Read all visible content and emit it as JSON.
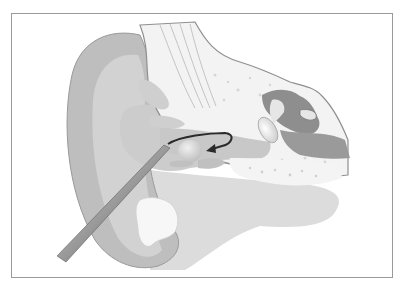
{
  "figure": {
    "style": "grayscale",
    "colors": {
      "background": "#ffffff",
      "frame": "#9a9a9a",
      "pinna_outer": "#bdbdbd",
      "pinna_inner": "#d0d0d0",
      "soft_tissue": "#dedede",
      "bone": "#f2f2f2",
      "bone_dark": "#8c8c8c",
      "canal": "#cfcfcf",
      "probe": "#888888",
      "arrow": "#2a2a2a"
    },
    "labels": []
  }
}
